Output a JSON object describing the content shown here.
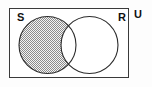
{
  "figure": {
    "kind": "venn-diagram",
    "width": 152,
    "height": 87,
    "background_color": "#fdfdfd"
  },
  "universal_set": {
    "label": "U",
    "label_position": "outside-top-right",
    "rect": {
      "x": 9,
      "y": 8,
      "width": 120,
      "height": 70
    },
    "border_color": "#3a3a3a",
    "border_width": 1,
    "fill_color": "#ffffff"
  },
  "sets": [
    {
      "id": "set-s",
      "label": "S",
      "label_position": "inside-top-left",
      "label_x": 17,
      "label_y": 21,
      "circle": {
        "cx": 47.5,
        "cy": 45,
        "r": 28.5
      },
      "stroke_color": "#2b2b2b",
      "stroke_width": 1,
      "fill_color": "#ffffff"
    },
    {
      "id": "set-r",
      "label": "R",
      "label_position": "inside-top-right",
      "label_x": 118,
      "label_y": 21,
      "circle": {
        "cx": 89.5,
        "cy": 45,
        "r": 28.5
      },
      "stroke_color": "#2b2b2b",
      "stroke_width": 1,
      "fill_color": "#ffffff"
    }
  ],
  "universal_label": {
    "text": "U",
    "label_x": 134,
    "label_y": 18
  },
  "shaded_region": {
    "description": "S minus R",
    "set_expression": "S \\ R",
    "included_sets": [
      "S"
    ],
    "excluded_sets": [
      "R"
    ],
    "includes_intersection": false,
    "pattern": "cross-hatch",
    "pattern_color": "#6e6e6e",
    "pattern_background": "#f2f2f2",
    "pattern_spacing_px": 2
  }
}
